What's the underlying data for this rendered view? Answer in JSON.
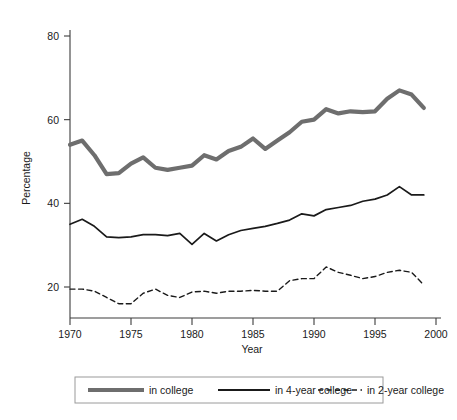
{
  "chart_data": {
    "type": "line",
    "title": "",
    "xlabel": "Year",
    "ylabel": "Percentage",
    "xlim": [
      1970,
      2000
    ],
    "ylim": [
      14,
      84
    ],
    "xticks": [
      1970,
      1975,
      1980,
      1985,
      1990,
      1995,
      2000
    ],
    "yticks": [
      20,
      40,
      60,
      80
    ],
    "grid": false,
    "legend_position": "bottom",
    "x": [
      1970,
      1971,
      1972,
      1973,
      1974,
      1975,
      1976,
      1977,
      1978,
      1979,
      1980,
      1981,
      1982,
      1983,
      1984,
      1985,
      1986,
      1987,
      1988,
      1989,
      1990,
      1991,
      1992,
      1993,
      1994,
      1995,
      1996,
      1997,
      1998,
      1999
    ],
    "series": [
      {
        "name": "in college",
        "style": "thick-gray",
        "color": "#6e6e6e",
        "values": [
          54.0,
          55.0,
          51.5,
          47.0,
          47.2,
          49.5,
          51.0,
          48.5,
          48.0,
          48.5,
          49.0,
          51.5,
          50.5,
          52.5,
          53.5,
          55.5,
          53.0,
          55.0,
          57.0,
          59.5,
          60.0,
          62.5,
          61.5,
          62.0,
          61.8,
          62.0,
          65.0,
          67.0,
          66.0,
          62.8
        ]
      },
      {
        "name": "in 4-year college",
        "style": "thin-black-solid",
        "color": "#1a1a1a",
        "values": [
          35.0,
          36.2,
          34.5,
          32.0,
          31.8,
          32.0,
          32.5,
          32.5,
          32.3,
          32.8,
          30.2,
          32.8,
          31.0,
          32.5,
          33.5,
          34.0,
          34.5,
          35.2,
          36.0,
          37.5,
          37.0,
          38.5,
          39.0,
          39.5,
          40.5,
          41.0,
          42.0,
          44.0,
          42.0,
          42.0
        ]
      },
      {
        "name": "in 2-year college",
        "style": "black-dashed",
        "color": "#1a1a1a",
        "values": [
          19.5,
          19.5,
          19.0,
          17.5,
          16.0,
          16.0,
          18.5,
          19.5,
          18.0,
          17.5,
          18.8,
          19.0,
          18.5,
          19.0,
          19.0,
          19.2,
          19.0,
          19.0,
          21.5,
          22.0,
          22.0,
          24.8,
          23.5,
          22.8,
          22.0,
          22.5,
          23.5,
          24.0,
          23.5,
          20.5
        ]
      }
    ]
  },
  "legend": {
    "items": [
      {
        "label": "in college",
        "swatch": "thick-gray-line-swatch"
      },
      {
        "label": "in 4-year college",
        "swatch": "thin-black-line-swatch"
      },
      {
        "label": "in 2-year college",
        "swatch": "black-dashed-line-swatch"
      }
    ]
  }
}
